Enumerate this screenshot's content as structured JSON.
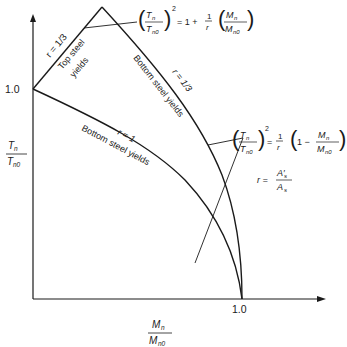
{
  "axes": {
    "y_label_num": "T",
    "y_label_num_sub": "n",
    "y_label_den": "T",
    "y_label_den_sub": "n0",
    "x_label_num": "M",
    "x_label_num_sub": "n",
    "x_label_den": "M",
    "x_label_den_sub": "n0",
    "y_tick": "1.0",
    "x_tick": "1.0"
  },
  "curves": {
    "r_third": {
      "param_label": "r = 1/3",
      "top_region_label_1": "Top steel",
      "top_region_label_2": "yields",
      "bottom_region_label": "Bottom steel yields",
      "bottom_param_label": "r = 1/3"
    },
    "r_one": {
      "param_label": "r = 1",
      "region_label": "Bottom steel yields"
    }
  },
  "equations": {
    "top": {
      "lhs_num": "T",
      "lhs_num_sub": "n",
      "lhs_den": "T",
      "lhs_den_sub": "n0",
      "exp": "2",
      "rhs_prefix": "= 1 +",
      "frac_num": "1",
      "frac_den": "r",
      "rhs_num": "M",
      "rhs_num_sub": "n",
      "rhs_den": "M",
      "rhs_den_sub": "n0"
    },
    "bottom": {
      "lhs_num": "T",
      "lhs_num_sub": "n",
      "lhs_den": "T",
      "lhs_den_sub": "n0",
      "exp": "2",
      "eq": "=",
      "frac_num": "1",
      "frac_den": "r",
      "paren_prefix": "1 −",
      "rhs_num": "M",
      "rhs_num_sub": "n",
      "rhs_den": "M",
      "rhs_den_sub": "n0"
    },
    "ratio": {
      "lhs": "r =",
      "num": "A′",
      "num_sub": "s",
      "den": "A",
      "den_sub": "s"
    }
  },
  "colors": {
    "line": "#1a1a1a",
    "background": "#ffffff"
  }
}
